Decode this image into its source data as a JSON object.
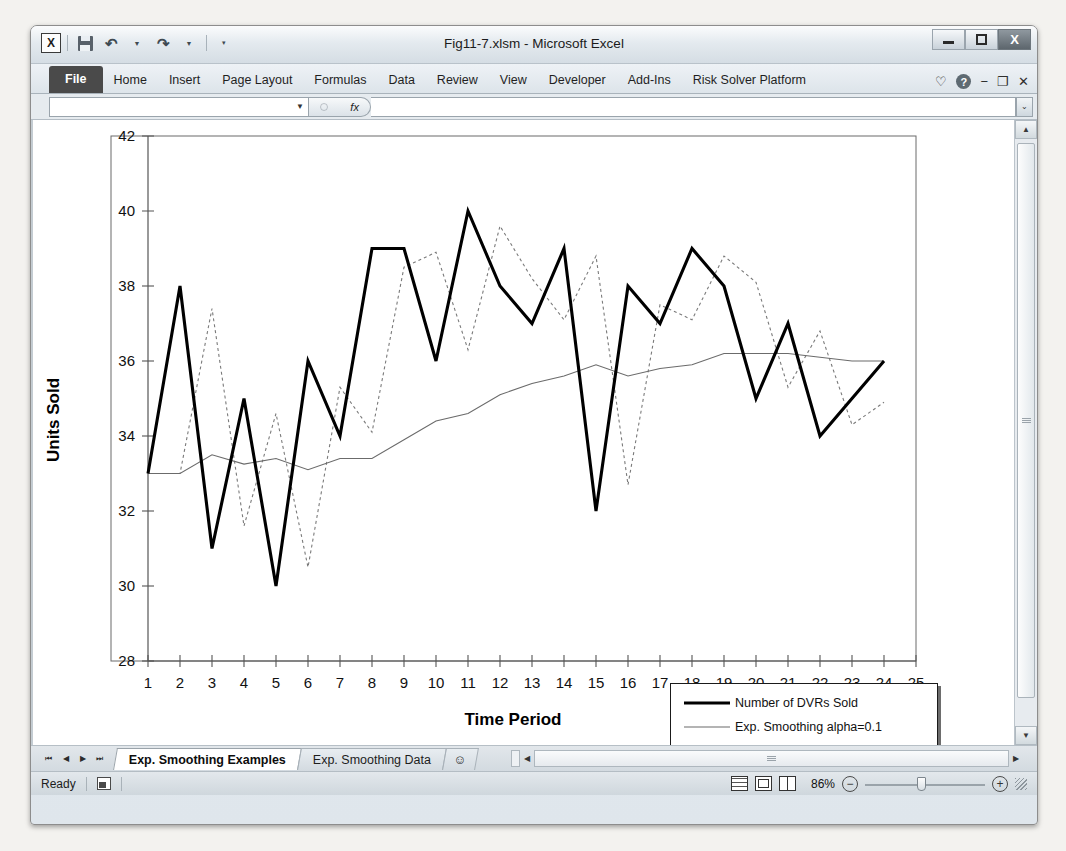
{
  "window": {
    "title": "Fig11-7.xlsm - Microsoft Excel",
    "logo": "X",
    "minimize": "minimize-icon",
    "restore": "restore-icon",
    "close": "X"
  },
  "quick_access": {
    "save": "save-icon",
    "undo": "↶",
    "redo": "↷",
    "customize": "≡"
  },
  "ribbon": {
    "tabs": [
      {
        "label": "File"
      },
      {
        "label": "Home"
      },
      {
        "label": "Insert"
      },
      {
        "label": "Page Layout"
      },
      {
        "label": "Formulas"
      },
      {
        "label": "Data"
      },
      {
        "label": "Review"
      },
      {
        "label": "View"
      },
      {
        "label": "Developer"
      },
      {
        "label": "Add-Ins"
      },
      {
        "label": "Risk Solver Platform"
      }
    ],
    "heart_icon": "♡",
    "help_icon": "?",
    "minimize_ribbon": "−",
    "restore_window": "❐",
    "close_window": "✕"
  },
  "formula_bar": {
    "name_box_value": "",
    "fx_label": "fx",
    "formula_value": "",
    "expand_caret": "⌄"
  },
  "chart_data": {
    "type": "line",
    "title": "",
    "xlabel": "Time Period",
    "ylabel": "Units Sold",
    "xlim": [
      1,
      25
    ],
    "ylim": [
      28,
      42
    ],
    "ytick_step": 2,
    "x": [
      1,
      2,
      3,
      4,
      5,
      6,
      7,
      8,
      9,
      10,
      11,
      12,
      13,
      14,
      15,
      16,
      17,
      18,
      19,
      20,
      21,
      22,
      23,
      24
    ],
    "xticks": [
      1,
      2,
      3,
      4,
      5,
      6,
      7,
      8,
      9,
      10,
      11,
      12,
      13,
      14,
      15,
      16,
      17,
      18,
      19,
      20,
      21,
      22,
      23,
      24,
      25
    ],
    "yticks": [
      28,
      30,
      32,
      34,
      36,
      38,
      40,
      42
    ],
    "grid": false,
    "legend_position": "inside-bottom-right",
    "series": [
      {
        "name": "Number of DVRs Sold",
        "style": "thick-solid",
        "values": [
          33,
          38,
          31,
          35,
          30,
          36,
          34,
          39,
          39,
          36,
          40,
          38,
          37,
          39,
          32,
          38,
          37,
          39,
          38,
          35,
          37,
          34,
          35,
          36
        ]
      },
      {
        "name": "Exp. Smoothing alpha=0.1",
        "style": "thin-solid",
        "values": [
          33,
          33,
          33.5,
          33.25,
          33.4,
          33.1,
          33.4,
          33.4,
          33.9,
          34.4,
          34.6,
          35.1,
          35.4,
          35.6,
          35.9,
          35.6,
          35.8,
          35.9,
          36.2,
          36.2,
          36.2,
          36.1,
          36.0,
          36.0
        ]
      },
      {
        "name": "Exp. Smoothing alpha=0.9",
        "style": "dotted",
        "values": [
          33,
          33,
          37.4,
          31.6,
          34.6,
          30.5,
          35.3,
          34.1,
          38.5,
          38.9,
          36.3,
          39.6,
          38.2,
          37.1,
          38.8,
          32.7,
          37.5,
          37.1,
          38.8,
          38.1,
          35.3,
          36.8,
          34.3,
          34.9
        ]
      }
    ]
  },
  "sheet_tabs": {
    "nav_first": "⏮",
    "nav_prev": "◀",
    "nav_next": "▶",
    "nav_last": "⏭",
    "tabs": [
      {
        "label": "Exp. Smoothing Examples",
        "active": true
      },
      {
        "label": "Exp. Smoothing Data",
        "active": false
      }
    ],
    "new_sheet_icon": "new-sheet-icon"
  },
  "status_bar": {
    "state": "Ready",
    "macro_icon": "record-macro-icon",
    "view_normal": "normal-view-icon",
    "view_page_layout": "page-layout-view-icon",
    "view_page_break": "page-break-view-icon",
    "zoom_level": "86%",
    "zoom_out": "−",
    "zoom_in": "+"
  },
  "scrollbars": {
    "v_up": "▲",
    "v_down": "▼",
    "h_left": "◀",
    "h_right": "▶"
  }
}
